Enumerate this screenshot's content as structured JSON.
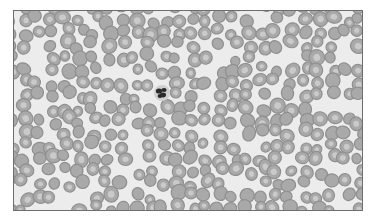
{
  "image": {
    "subject": "peripheral blood smear",
    "description": "Grayscale micrograph of densely packed red blood cells with a single dark segmented-nucleus white blood cell near the upper center",
    "frame": {
      "x": 13,
      "y": 10,
      "width": 348,
      "height": 199,
      "border_color": "#6e6e6e"
    },
    "colors": {
      "background": "#ececec",
      "cell_rim": "#8f8f8f",
      "cell_fill": "#a9a9a9",
      "cell_pallor": "#d2d2d2",
      "nucleus": "#2a2a2a"
    },
    "wbc": {
      "cx": 148,
      "cy": 82,
      "r": 7
    },
    "rbc_grid": {
      "spacing": 14,
      "radius_min": 5,
      "radius_max": 7
    }
  }
}
